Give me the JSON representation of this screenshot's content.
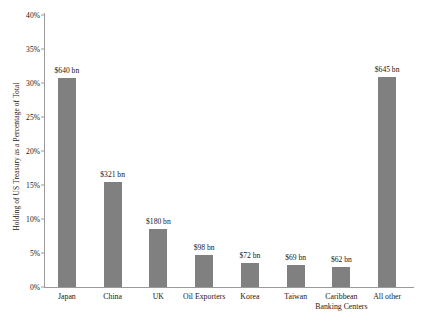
{
  "chart_data": {
    "type": "bar",
    "title": "",
    "xlabel": "",
    "ylabel": "Holding of US Treasury as a Percentage of Total",
    "ylim": [
      0,
      40
    ],
    "ytick_labels": [
      "40%",
      "35%",
      "30%",
      "25%",
      "20%",
      "15%",
      "10%",
      "5%",
      "0%"
    ],
    "ytick_values": [
      40,
      35,
      30,
      25,
      20,
      15,
      10,
      5,
      0
    ],
    "grid": false,
    "legend": null,
    "bar_color": "#808080",
    "axis_color": "#9a9a9a",
    "categories": [
      "Japan",
      "China",
      "UK",
      "Oil Exporters",
      "Korea",
      "Taiwan",
      "Caribbean Banking Centers",
      "All other"
    ],
    "category_lines": [
      [
        "Japan",
        ""
      ],
      [
        "China",
        ""
      ],
      [
        "UK",
        ""
      ],
      [
        "Oil Exporters",
        ""
      ],
      [
        "Korea",
        ""
      ],
      [
        "Taiwan",
        ""
      ],
      [
        "Caribbean",
        "Banking Centers"
      ],
      [
        "All other",
        ""
      ]
    ],
    "values": [
      30.7,
      15.4,
      8.6,
      4.7,
      3.5,
      3.3,
      3.0,
      30.9
    ],
    "data_labels": [
      "$640 bn",
      "$321 bn",
      "$180 bn",
      "$98 bn",
      "$72 bn",
      "$69 bn",
      "$62 bn",
      "$645 bn"
    ]
  }
}
